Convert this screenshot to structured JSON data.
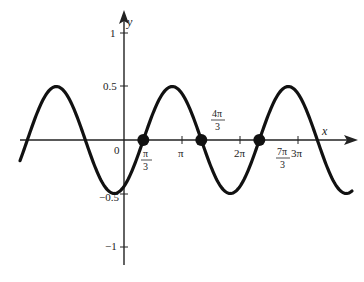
{
  "chart_data": {
    "type": "line",
    "title": "",
    "function": "y = 0.5 sin(x - pi/3)",
    "xlabel": "x",
    "ylabel": "y",
    "x_ticks": [
      "π",
      "2π",
      "3π"
    ],
    "x_tick_values": [
      3.1416,
      6.2832,
      9.4248
    ],
    "y_ticks": [
      "1",
      "0.5",
      "−0.5",
      "−1"
    ],
    "y_tick_values": [
      1,
      0.5,
      -0.5,
      -1
    ],
    "origin_label": "0",
    "ylim": [
      -1.1,
      1.1
    ],
    "xlim": [
      -5.6,
      10.0
    ],
    "amplitude": 0.5,
    "period": "2π",
    "phase_shift": "π/3",
    "grid": false,
    "highlighted_points": [
      {
        "x_label": "π/3",
        "x": 1.0472,
        "y": 0
      },
      {
        "x_label": "4π/3",
        "x": 4.1888,
        "y": 0
      },
      {
        "x_label": "7π/3",
        "x": 7.3304,
        "y": 0
      }
    ],
    "series": [
      {
        "name": "curve",
        "x": [
          -5.24,
          -3.67,
          -2.09,
          -0.52,
          1.05,
          2.62,
          4.19,
          5.76,
          7.33,
          8.9
        ],
        "values": [
          0,
          0.5,
          0,
          -0.5,
          0,
          0.5,
          0,
          -0.5,
          0,
          0.5
        ]
      }
    ]
  }
}
